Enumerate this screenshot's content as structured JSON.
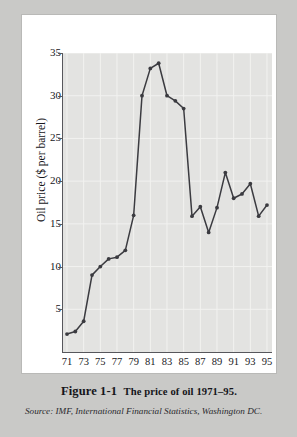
{
  "figure": {
    "caption_prefix": "Figure 1-1",
    "caption_text": "The price of oil 1971–95.",
    "source_label": "Source:",
    "source_text": "IMF, International Financial Statistics, Washington DC."
  },
  "chart_data": {
    "type": "line",
    "title": "The price of oil 1971–95",
    "xlabel": "",
    "ylabel": "Oil price ($ per barrel)",
    "xlim": [
      1970.4,
      1995.6
    ],
    "ylim": [
      0,
      35
    ],
    "yticks": [
      5,
      10,
      15,
      20,
      25,
      30,
      35
    ],
    "ytick_labels": [
      "5",
      "10",
      "15",
      "20",
      "25",
      "30",
      "35"
    ],
    "xticks": [
      1971,
      1973,
      1975,
      1977,
      1979,
      1981,
      1983,
      1985,
      1987,
      1989,
      1991,
      1993,
      1995
    ],
    "xtick_labels": [
      "71",
      "73",
      "75",
      "77",
      "79",
      "81",
      "83",
      "85",
      "87",
      "89",
      "91",
      "93",
      "95"
    ],
    "grid": true,
    "legend": "none",
    "marker": "filled-circle",
    "line_color": "#3b3b40",
    "plot_background": "#e3e3e1",
    "grid_color": "#f2f2f0",
    "x": [
      1971,
      1972,
      1973,
      1974,
      1975,
      1976,
      1977,
      1978,
      1979,
      1980,
      1981,
      1982,
      1983,
      1984,
      1985,
      1986,
      1987,
      1988,
      1989,
      1990,
      1991,
      1992,
      1993,
      1994,
      1995
    ],
    "values": [
      2.1,
      2.4,
      3.6,
      9.0,
      10.0,
      10.9,
      11.1,
      11.9,
      16.0,
      30.0,
      33.2,
      33.8,
      30.0,
      29.4,
      28.5,
      15.9,
      17.0,
      14.0,
      16.9,
      21.0,
      18.0,
      18.5,
      19.7,
      15.9,
      17.2
    ],
    "series_name": "Oil price"
  },
  "colors": {
    "page_margin": "#c9c9c7",
    "paper": "#ffffff",
    "ink": "#17171b",
    "plot_bg": "#e3e3e1",
    "gridline": "#f2f2f0",
    "axis": "#57575c",
    "data_line": "#3b3b40"
  }
}
